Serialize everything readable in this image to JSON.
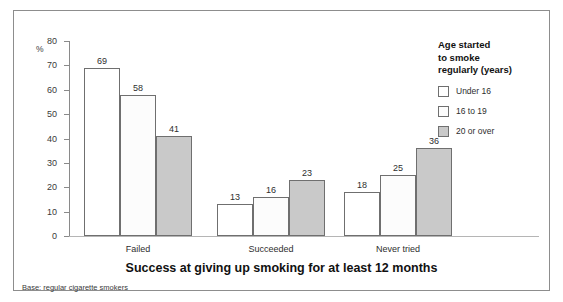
{
  "chart_data": {
    "type": "bar",
    "title": "Success at giving up smoking for at least 12 months",
    "subtitle": "",
    "xlabel": "",
    "ylabel": "%",
    "ylim": [
      0,
      80
    ],
    "ytick_step": 10,
    "yticks": [
      80,
      70,
      60,
      50,
      40,
      30,
      20,
      10,
      0
    ],
    "grid": false,
    "legend_position": "right",
    "legend_title": "Age started to smoke regularly (years)",
    "categories": [
      "Failed",
      "Succeeded",
      "Never tried"
    ],
    "series": [
      {
        "name": "Under 16",
        "values": [
          69,
          13,
          18
        ],
        "color": "#ffffff"
      },
      {
        "name": "16 to 19",
        "values": [
          58,
          16,
          25
        ],
        "color": "#fcfcfc"
      },
      {
        "name": "20 or over",
        "values": [
          41,
          23,
          36
        ],
        "color": "#c9c9c9"
      }
    ],
    "annotations": [
      "Base: regular cigarette smokers"
    ]
  },
  "axis": {
    "unit_label": "%"
  },
  "legend": {
    "title_line1": "Age started",
    "title_line2": "to smoke",
    "title_line3": "regularly (years)",
    "items": [
      {
        "label": "Under 16"
      },
      {
        "label": "16 to 19"
      },
      {
        "label": "20 or over"
      }
    ]
  },
  "caption": {
    "title": "Success at giving up smoking for at least 12 months",
    "base_note": "Base: regular cigarette smokers"
  }
}
